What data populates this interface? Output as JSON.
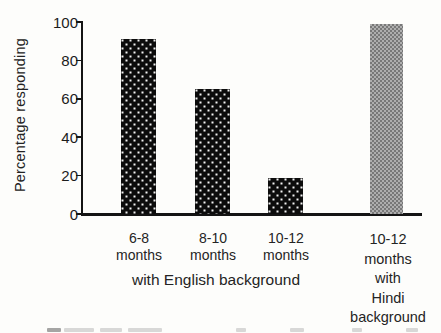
{
  "figure": {
    "background_color": "#fdfdfb",
    "text_color": "#1c1c1c"
  },
  "chart_data": {
    "type": "bar",
    "title": "",
    "ylabel": "Percentage responding",
    "xlabel": "with English background",
    "categories": [
      "6-8 months",
      "8-10 months",
      "10-12 months",
      "10-12 months with Hindi background"
    ],
    "x_tick_lines": [
      [
        "6-8",
        "months"
      ],
      [
        "8-10",
        "months"
      ],
      [
        "10-12",
        "months"
      ],
      [
        "10-12",
        "months",
        "with",
        "Hindi",
        "background"
      ]
    ],
    "values": [
      91,
      65,
      19,
      99
    ],
    "ylim": [
      0,
      100
    ],
    "yticks": [
      0,
      20,
      40,
      60,
      80,
      100
    ],
    "grid": false,
    "legend": "none",
    "bar_styles": [
      "black-dotted",
      "black-dotted",
      "black-dotted",
      "gray-checker"
    ],
    "bar_colors": {
      "black-dotted": "#0c0c0c",
      "gray-checker": "#9b9b9b"
    }
  }
}
